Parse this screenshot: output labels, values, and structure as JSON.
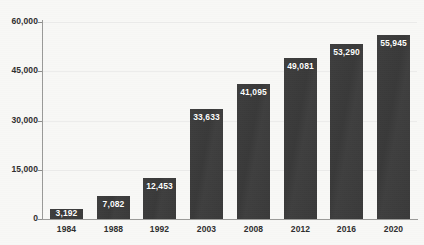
{
  "chart_data": {
    "type": "bar",
    "title": "",
    "subtitle": "",
    "xlabel": "",
    "ylabel": "",
    "categories": [
      "1984",
      "1988",
      "1992",
      "2003",
      "2008",
      "2012",
      "2016",
      "2020"
    ],
    "values": [
      3192,
      7082,
      12453,
      33633,
      41095,
      49081,
      53290,
      55945
    ],
    "value_labels": [
      "3,192",
      "7,082",
      "12,453",
      "33,633",
      "41,095",
      "49,081",
      "53,290",
      "55,945"
    ],
    "ylim": [
      0,
      60000
    ],
    "y_ticks": [
      0,
      15000,
      30000,
      45000,
      60000
    ],
    "y_tick_labels": [
      "0",
      "15,000",
      "30,000",
      "45,000",
      "60,000"
    ],
    "grid": "horizontal",
    "legend": "none",
    "bar_color": "#3b3b3b",
    "value_label_color": "#ffffff",
    "axis_color": "#9a9a98",
    "gridline_color": "#ececeb",
    "background_color": "#f8f8f6",
    "text_color": "#2e2e2e"
  }
}
